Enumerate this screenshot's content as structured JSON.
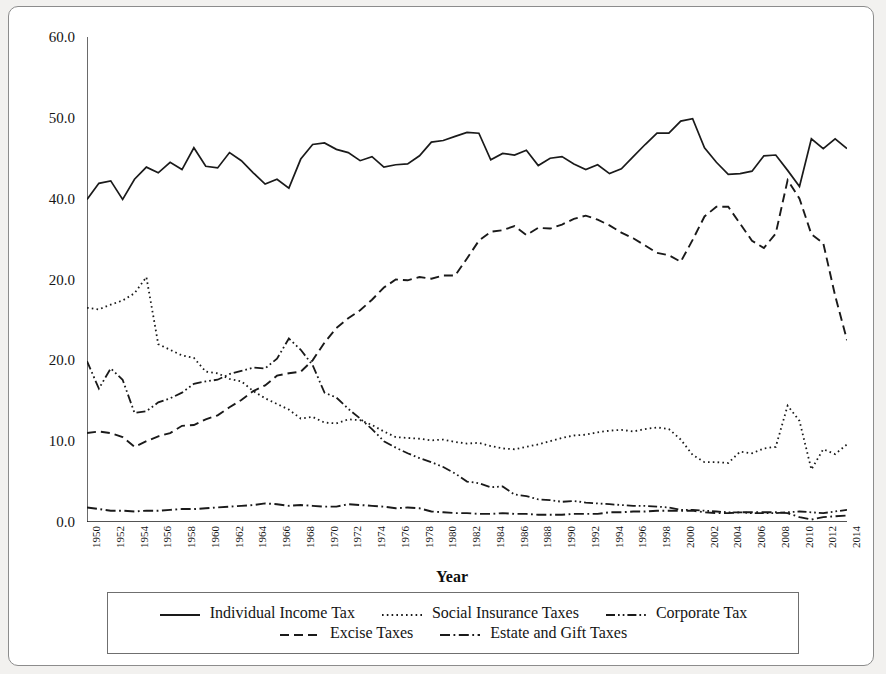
{
  "figure": {
    "background_color": "#f2f1ef",
    "panel_color": "#ffffff",
    "border_color": "#8c8c8c",
    "line_color": "#1a1a1a"
  },
  "axis": {
    "x_title": "Year",
    "y_title": ""
  },
  "legend": {
    "rows": [
      [
        {
          "label": "Individual Income Tax",
          "style": "solid",
          "name": "legend-individual-income-tax"
        },
        {
          "label": "Social Insurance Taxes",
          "style": "dotted",
          "name": "legend-social-insurance-taxes"
        },
        {
          "label": "Corporate Tax",
          "style": "dashdotdot",
          "name": "legend-corporate-tax"
        }
      ],
      [
        {
          "label": "Excise Taxes",
          "style": "dashed",
          "name": "legend-excise-taxes"
        },
        {
          "label": "Estate and Gift Taxes",
          "style": "dashdot",
          "name": "legend-estate-and-gift-taxes"
        }
      ]
    ]
  },
  "chart_data": {
    "type": "line",
    "title": "",
    "xlabel": "Year",
    "ylabel": "",
    "xlim": [
      1950,
      2014
    ],
    "ylim": [
      0.0,
      60.0
    ],
    "grid": false,
    "legend_position": "bottom",
    "y_ticks": [
      0.0,
      10.0,
      20.0,
      20.0,
      40.0,
      50.0,
      60.0
    ],
    "y_tick_labels": [
      "0.0",
      "10.0",
      "20.0",
      "20.0",
      "40.0",
      "50.0",
      "60.0"
    ],
    "y_tick_values_actual": [
      0.0,
      10.0,
      20.0,
      30.0,
      40.0,
      50.0,
      60.0
    ],
    "y_tick_note": "Fourth label from top is printed as 20.0 in the source figure though its position corresponds to 30.0",
    "x": [
      1950,
      1951,
      1952,
      1953,
      1954,
      1955,
      1956,
      1957,
      1958,
      1959,
      1960,
      1961,
      1962,
      1963,
      1964,
      1965,
      1966,
      1967,
      1968,
      1969,
      1970,
      1971,
      1972,
      1973,
      1974,
      1975,
      1976,
      1977,
      1978,
      1979,
      1980,
      1981,
      1982,
      1983,
      1984,
      1985,
      1986,
      1987,
      1988,
      1989,
      1990,
      1991,
      1992,
      1993,
      1994,
      1995,
      1996,
      1997,
      1998,
      1999,
      2000,
      2001,
      2002,
      2003,
      2004,
      2005,
      2006,
      2007,
      2008,
      2009,
      2010,
      2011,
      2012,
      2013,
      2014
    ],
    "x_tick_labels": [
      "1950",
      "1952",
      "1954",
      "1956",
      "1958",
      "1960",
      "1962",
      "1964",
      "1966",
      "1968",
      "1970",
      "1972",
      "1974",
      "1976",
      "1978",
      "1980",
      "1982",
      "1984",
      "1986",
      "1988",
      "1990",
      "1992",
      "1994",
      "1996",
      "1998",
      "2000",
      "2002",
      "2004",
      "2006",
      "2008",
      "2010",
      "2012",
      "2014"
    ],
    "x_tick_step": 2,
    "x_tick_rotation": 90,
    "series": [
      {
        "name": "Individual Income Tax",
        "style": "solid",
        "values": [
          39.9,
          41.9,
          42.2,
          39.9,
          42.4,
          43.9,
          43.2,
          44.5,
          43.6,
          46.3,
          44.0,
          43.8,
          45.7,
          44.7,
          43.2,
          41.8,
          42.4,
          41.3,
          44.9,
          46.7,
          46.9,
          46.1,
          45.7,
          44.7,
          45.2,
          43.9,
          44.2,
          44.3,
          45.3,
          47.0,
          47.2,
          47.7,
          48.2,
          48.1,
          44.8,
          45.6,
          45.4,
          46.0,
          44.1,
          45.0,
          45.2,
          44.3,
          43.6,
          44.2,
          43.1,
          43.7,
          45.2,
          46.7,
          48.1,
          48.1,
          49.6,
          49.9,
          46.3,
          44.5,
          43.0,
          43.1,
          43.4,
          45.3,
          45.4,
          43.5,
          41.5,
          47.4,
          46.2,
          47.4,
          46.2
        ],
        "label_color": "#1a1a1a"
      },
      {
        "name": "Social Insurance Taxes",
        "style": "dotted",
        "values": [
          26.5,
          26.3,
          26.9,
          27.4,
          28.3,
          30.3,
          22.0,
          21.3,
          20.6,
          20.3,
          18.6,
          18.4,
          17.7,
          17.4,
          16.2,
          15.3,
          14.6,
          13.9,
          12.8,
          13.0,
          12.3,
          12.2,
          12.7,
          12.6,
          12.0,
          11.2,
          10.5,
          10.4,
          10.3,
          10.1,
          10.2,
          9.9,
          9.7,
          9.8,
          9.4,
          9.1,
          9.0,
          9.3,
          9.6,
          10.0,
          10.4,
          10.7,
          10.8,
          11.1,
          11.3,
          11.4,
          11.2,
          11.5,
          11.7,
          11.5,
          10.2,
          8.3,
          7.4,
          7.4,
          7.3,
          8.7,
          8.5,
          9.1,
          9.3,
          14.4,
          12.5,
          6.5,
          9.0,
          8.4,
          9.6
        ],
        "label_color": "#1a1a1a"
      },
      {
        "name": "Corporate Tax",
        "style": "dashdotdot",
        "values": [
          19.9,
          16.5,
          19.0,
          17.6,
          13.5,
          13.7,
          14.8,
          15.3,
          16.0,
          17.1,
          17.4,
          17.6,
          18.3,
          18.7,
          19.1,
          19.0,
          20.2,
          22.7,
          21.3,
          19.4,
          16.0,
          15.4,
          14.0,
          12.8,
          11.5,
          10.0,
          9.2,
          8.5,
          7.9,
          7.4,
          6.8,
          6.0,
          5.0,
          4.8,
          4.3,
          4.4,
          3.4,
          3.2,
          2.8,
          2.7,
          2.5,
          2.6,
          2.4,
          2.3,
          2.2,
          2.1,
          2.0,
          2.0,
          1.9,
          1.8,
          1.5,
          1.5,
          1.4,
          1.3,
          1.2,
          1.2,
          1.1,
          1.1,
          1.1,
          1.2,
          1.3,
          1.2,
          1.1,
          1.3,
          1.5
        ],
        "label_color": "#1a1a1a"
      },
      {
        "name": "Excise Taxes",
        "style": "dashed",
        "values": [
          11.0,
          11.0,
          11.0,
          11.0,
          9.3,
          10.0,
          10.2,
          10.8,
          11.5,
          11.6,
          12.0,
          12.2,
          12.4,
          12.3,
          12.2,
          12.4,
          11.6,
          10.7,
          9.5,
          8.6,
          8.1,
          7.3,
          6.5,
          5.9,
          5.2,
          5.0,
          4.8,
          4.6,
          4.2,
          4.5,
          4.0,
          3.8,
          3.5,
          3.5,
          3.4,
          3.3,
          2.7,
          2.4,
          2.2,
          2.0,
          2.0,
          1.9,
          1.8,
          1.8,
          1.9,
          1.9,
          1.8,
          1.8,
          1.7,
          1.6,
          1.5,
          1.6,
          1.7,
          1.6,
          1.5,
          1.5,
          1.5,
          1.4,
          1.4,
          1.6,
          1.5,
          1.4,
          1.3,
          1.3,
          1.3
        ],
        "excise_actual": [
          11.0,
          11.2,
          11.0,
          10.5,
          9.3,
          10.0,
          10.6,
          11.0,
          11.9,
          12.0,
          12.7,
          13.2,
          14.2,
          15.1,
          16.2,
          16.9,
          18.1,
          18.4,
          18.6,
          20.0,
          22.2,
          24.0,
          25.2,
          26.2,
          27.5,
          29.0,
          30.0,
          29.9,
          30.3,
          30.1,
          30.5,
          30.5,
          32.6,
          34.8,
          35.9,
          36.1,
          36.6,
          35.5,
          36.4,
          36.3,
          36.8,
          37.5,
          37.9,
          37.4,
          36.7,
          35.8,
          35.1,
          34.2,
          33.3,
          33.0,
          32.2,
          34.9,
          37.8,
          39.0,
          39.0,
          36.9,
          34.8,
          33.9,
          35.7,
          42.3,
          40.0,
          35.6,
          34.5,
          28.0,
          22.5
        ],
        "values_used": "excise_actual",
        "label_color": "#1a1a1a"
      },
      {
        "name": "Estate and Gift Taxes",
        "style": "dashdot",
        "values": [
          1.8,
          1.6,
          1.4,
          1.4,
          1.3,
          1.4,
          1.4,
          1.5,
          1.6,
          1.6,
          1.7,
          1.8,
          1.9,
          2.0,
          2.1,
          2.3,
          2.2,
          2.0,
          2.1,
          2.0,
          1.9,
          1.9,
          2.2,
          2.1,
          2.0,
          1.9,
          1.7,
          1.8,
          1.7,
          1.3,
          1.2,
          1.1,
          1.1,
          1.0,
          1.0,
          1.1,
          1.0,
          1.0,
          0.9,
          0.9,
          0.9,
          1.0,
          1.0,
          1.0,
          1.2,
          1.2,
          1.3,
          1.3,
          1.4,
          1.4,
          1.4,
          1.4,
          1.2,
          1.1,
          1.1,
          1.2,
          1.2,
          1.2,
          1.2,
          1.1,
          0.6,
          0.3,
          0.6,
          0.7,
          0.8
        ],
        "label_color": "#1a1a1a"
      }
    ]
  }
}
